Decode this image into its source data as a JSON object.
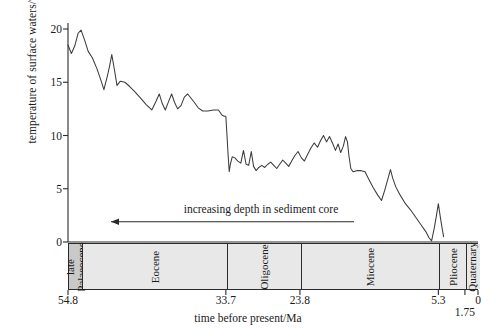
{
  "chart_data": {
    "type": "line",
    "title": "",
    "xlabel": "time before present/Ma",
    "ylabel": "temperature of surface waters/°C",
    "x_axis_direction": "reversed",
    "xlim": [
      54.8,
      0
    ],
    "ylim": [
      0,
      20
    ],
    "grid": false,
    "legend": null,
    "y_ticks": [
      0,
      5,
      10,
      15,
      20
    ],
    "y_tick_labels": [
      "0",
      "5",
      "10",
      "15",
      "20"
    ],
    "x_ticks": [
      54.8,
      33.7,
      23.8,
      5.3,
      1.75,
      0
    ],
    "x_tick_labels": [
      "54.8",
      "33.7",
      "23.8",
      "5.3",
      "1.75",
      "0"
    ],
    "annotations": [
      {
        "text": "increasing depth in sediment core",
        "arrow": "left",
        "x_center_ma": 29.0,
        "y": 1.9
      }
    ],
    "epochs": [
      {
        "name": "late Palaeocene",
        "lines": [
          "late",
          "Palaeocene"
        ],
        "from_ma": 54.8,
        "to_ma": 53.0,
        "shade": "#c9c9c9"
      },
      {
        "name": "Eocene",
        "lines": [
          "Eocene"
        ],
        "from_ma": 53.0,
        "to_ma": 33.7,
        "shade": "#e8e8e8"
      },
      {
        "name": "Oligocene",
        "lines": [
          "Oligocene"
        ],
        "from_ma": 33.7,
        "to_ma": 23.8,
        "shade": "#e8e8e8"
      },
      {
        "name": "Miocene",
        "lines": [
          "Miocene"
        ],
        "from_ma": 23.8,
        "to_ma": 5.3,
        "shade": "#e8e8e8"
      },
      {
        "name": "Pliocene",
        "lines": [
          "Pliocene"
        ],
        "from_ma": 5.3,
        "to_ma": 1.75,
        "shade": "#e8e8e8"
      },
      {
        "name": "Quaternary",
        "lines": [
          "Quaternary"
        ],
        "from_ma": 1.75,
        "to_ma": 0.0,
        "shade": "#e8e8e8"
      }
    ],
    "series": [
      {
        "name": "temperature of surface waters",
        "color": "#3c3c3c",
        "points": [
          [
            54.8,
            18.5
          ],
          [
            54.35,
            17.7
          ],
          [
            53.9,
            18.4
          ],
          [
            53.45,
            19.6
          ],
          [
            53.05,
            19.9
          ],
          [
            52.6,
            19.0
          ],
          [
            52.1,
            17.9
          ],
          [
            51.55,
            17.3
          ],
          [
            50.95,
            16.3
          ],
          [
            50.45,
            15.3
          ],
          [
            50.0,
            14.3
          ],
          [
            49.6,
            15.4
          ],
          [
            49.25,
            16.5
          ],
          [
            48.95,
            17.6
          ],
          [
            48.6,
            16.2
          ],
          [
            48.25,
            14.7
          ],
          [
            47.8,
            15.1
          ],
          [
            47.2,
            15.0
          ],
          [
            46.55,
            14.6
          ],
          [
            45.85,
            14.1
          ],
          [
            45.1,
            13.5
          ],
          [
            44.35,
            12.9
          ],
          [
            43.6,
            12.4
          ],
          [
            43.05,
            13.2
          ],
          [
            42.6,
            13.9
          ],
          [
            42.2,
            13.0
          ],
          [
            41.8,
            12.4
          ],
          [
            41.35,
            13.2
          ],
          [
            40.95,
            13.9
          ],
          [
            40.55,
            13.1
          ],
          [
            40.15,
            12.5
          ],
          [
            39.7,
            12.8
          ],
          [
            39.25,
            13.6
          ],
          [
            38.8,
            13.9
          ],
          [
            38.35,
            13.5
          ],
          [
            37.9,
            13.1
          ],
          [
            37.4,
            12.6
          ],
          [
            36.8,
            12.3
          ],
          [
            36.1,
            12.3
          ],
          [
            35.4,
            12.4
          ],
          [
            34.7,
            12.4
          ],
          [
            34.2,
            11.9
          ],
          [
            33.9,
            11.8
          ],
          [
            33.7,
            11.8
          ],
          [
            33.55,
            10.0
          ],
          [
            33.4,
            8.2
          ],
          [
            33.25,
            6.6
          ],
          [
            33.1,
            7.3
          ],
          [
            32.85,
            8.0
          ],
          [
            32.5,
            7.9
          ],
          [
            32.1,
            7.6
          ],
          [
            31.7,
            7.4
          ],
          [
            31.35,
            8.6
          ],
          [
            31.0,
            7.3
          ],
          [
            30.65,
            7.2
          ],
          [
            30.3,
            8.5
          ],
          [
            30.0,
            7.1
          ],
          [
            29.65,
            6.7
          ],
          [
            29.3,
            7.0
          ],
          [
            28.9,
            7.2
          ],
          [
            28.5,
            7.0
          ],
          [
            28.1,
            7.3
          ],
          [
            27.7,
            7.5
          ],
          [
            27.3,
            7.2
          ],
          [
            26.9,
            6.9
          ],
          [
            26.5,
            7.3
          ],
          [
            26.1,
            7.7
          ],
          [
            25.7,
            7.4
          ],
          [
            25.3,
            7.1
          ],
          [
            24.9,
            7.6
          ],
          [
            24.5,
            8.1
          ],
          [
            24.05,
            8.5
          ],
          [
            23.6,
            7.9
          ],
          [
            23.2,
            7.6
          ],
          [
            22.8,
            8.2
          ],
          [
            22.35,
            8.8
          ],
          [
            21.9,
            9.3
          ],
          [
            21.45,
            8.9
          ],
          [
            21.05,
            9.5
          ],
          [
            20.65,
            10.0
          ],
          [
            20.25,
            9.4
          ],
          [
            19.85,
            9.9
          ],
          [
            19.45,
            9.3
          ],
          [
            19.05,
            8.6
          ],
          [
            18.7,
            9.2
          ],
          [
            18.35,
            8.4
          ],
          [
            18.0,
            9.0
          ],
          [
            17.7,
            9.9
          ],
          [
            17.45,
            9.4
          ],
          [
            17.25,
            8.1
          ],
          [
            17.0,
            6.9
          ],
          [
            16.7,
            6.6
          ],
          [
            16.2,
            6.7
          ],
          [
            15.6,
            6.7
          ],
          [
            15.1,
            6.6
          ],
          [
            14.6,
            5.9
          ],
          [
            14.0,
            5.1
          ],
          [
            13.4,
            4.4
          ],
          [
            12.9,
            3.9
          ],
          [
            12.45,
            4.9
          ],
          [
            12.05,
            5.9
          ],
          [
            11.7,
            6.8
          ],
          [
            11.4,
            6.0
          ],
          [
            11.0,
            5.2
          ],
          [
            10.4,
            4.4
          ],
          [
            9.7,
            3.6
          ],
          [
            9.0,
            3.0
          ],
          [
            8.3,
            2.3
          ],
          [
            7.6,
            1.6
          ],
          [
            7.0,
            1.0
          ],
          [
            6.55,
            0.4
          ],
          [
            6.2,
            0.1
          ],
          [
            5.85,
            1.3
          ],
          [
            5.55,
            2.5
          ],
          [
            5.3,
            3.6
          ],
          [
            5.05,
            2.4
          ],
          [
            4.8,
            1.3
          ],
          [
            4.6,
            0.5
          ]
        ]
      }
    ]
  }
}
